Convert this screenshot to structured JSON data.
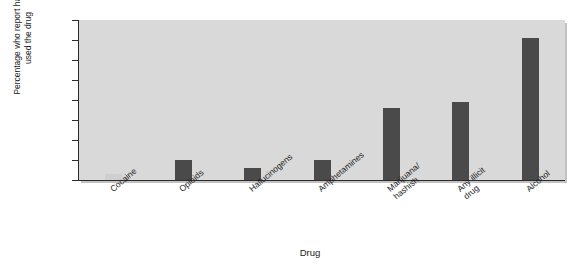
{
  "chart_data": {
    "type": "bar",
    "title": "",
    "xlabel": "Drug",
    "ylabel": "Percentage who report having\nused the drug",
    "categories": [
      "Cocaine",
      "Opioids",
      "Hallucinogens",
      "Amphetamines",
      "Marijuana/\nhashish",
      "Any illicit\ndrug",
      "Alcohol"
    ],
    "values": [
      3,
      10,
      6,
      10,
      36,
      39,
      71
    ],
    "ylim": [
      0,
      80
    ],
    "yticks": [
      0,
      10,
      20,
      30,
      40,
      50,
      60,
      70,
      80
    ],
    "ytick_labels": [
      "0",
      "10",
      "20",
      "30",
      "40",
      "50",
      "60",
      "70",
      "80"
    ],
    "grid": false,
    "legend": "none",
    "bar_color": "#4a4a4a",
    "pale_bar_color": "#cfcfcf",
    "plot_background": "#d9d9d9",
    "axis_color": "#2b2b2b"
  }
}
